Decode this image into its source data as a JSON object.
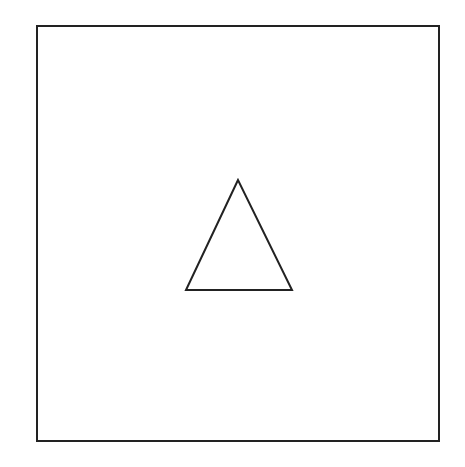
{
  "diagram": {
    "background": "#ffffff",
    "stroke_color": "#222222",
    "frame": {
      "shape": "square",
      "x": 37,
      "y": 26,
      "width": 402,
      "height": 415,
      "stroke_width": 2
    },
    "shapes": [
      {
        "shape": "triangle",
        "points": [
          [
            238,
            180
          ],
          [
            186,
            290
          ],
          [
            292,
            290
          ]
        ],
        "stroke_width": 2,
        "fill": "none"
      }
    ]
  }
}
